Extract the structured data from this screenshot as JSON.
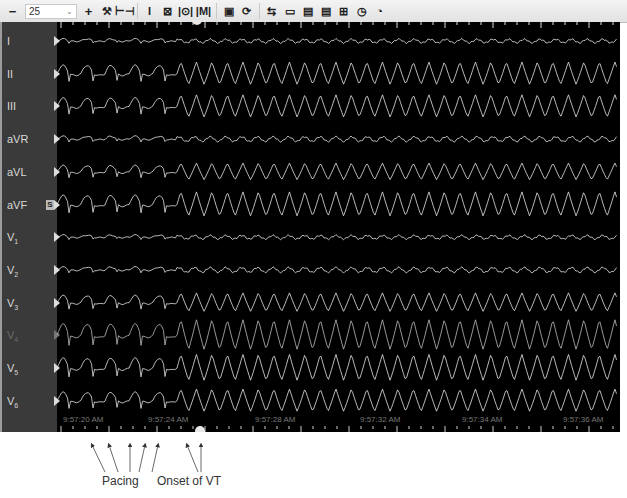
{
  "toolbar": {
    "zoom_out_symbol": "−",
    "zoom_value": "25",
    "zoom_in_symbol": "+",
    "tools": [
      {
        "name": "settings-tools-icon",
        "glyph": "⚒"
      },
      {
        "name": "horizontal-caliper-icon",
        "glyph": "⊢⊣"
      },
      {
        "name": "vertical-caliper-icon",
        "glyph": "I"
      },
      {
        "name": "box-x-icon",
        "glyph": "⊠"
      },
      {
        "name": "interval-measure-icon",
        "glyph": "|⊙|"
      },
      {
        "name": "interval-measure-alt-icon",
        "glyph": "|M|"
      },
      {
        "name": "monitor-icon",
        "glyph": "▣"
      },
      {
        "name": "cycle-icon",
        "glyph": "⟳"
      },
      {
        "name": "split-icon",
        "glyph": "⇆"
      },
      {
        "name": "folder-icon",
        "glyph": "▭"
      },
      {
        "name": "print-icon",
        "glyph": "▤"
      },
      {
        "name": "print-alt-icon",
        "glyph": "▤"
      },
      {
        "name": "grid-icon",
        "glyph": "⊞"
      },
      {
        "name": "clock-icon",
        "glyph": "◷"
      },
      {
        "name": "stopwatch-icon",
        "glyph": "◔"
      }
    ]
  },
  "leads": [
    {
      "label": "I",
      "sub": "",
      "dim": false,
      "badge": ""
    },
    {
      "label": "II",
      "sub": "",
      "dim": false,
      "badge": ""
    },
    {
      "label": "III",
      "sub": "",
      "dim": false,
      "badge": ""
    },
    {
      "label": "aVR",
      "sub": "",
      "dim": false,
      "badge": ""
    },
    {
      "label": "aVL",
      "sub": "",
      "dim": false,
      "badge": ""
    },
    {
      "label": "aVF",
      "sub": "",
      "dim": false,
      "badge": "S"
    },
    {
      "label": "V",
      "sub": "1",
      "dim": false,
      "badge": ""
    },
    {
      "label": "V",
      "sub": "2",
      "dim": false,
      "badge": ""
    },
    {
      "label": "V",
      "sub": "3",
      "dim": false,
      "badge": ""
    },
    {
      "label": "V",
      "sub": "4",
      "dim": true,
      "badge": ""
    },
    {
      "label": "V",
      "sub": "5",
      "dim": false,
      "badge": ""
    },
    {
      "label": "V",
      "sub": "6",
      "dim": false,
      "badge": ""
    }
  ],
  "time_labels": [
    "9:57:20 AM",
    "9:57:24 AM",
    "9:57:28 AM",
    "9:57:32 AM",
    "9:57:34 AM",
    "9:57:36 AM"
  ],
  "annotations": {
    "pacing": "Pacing",
    "onset": "Onset of VT"
  },
  "colors": {
    "trace": "#e6e6e6",
    "background": "#000000",
    "lead_panel": "#3a3a3a"
  }
}
